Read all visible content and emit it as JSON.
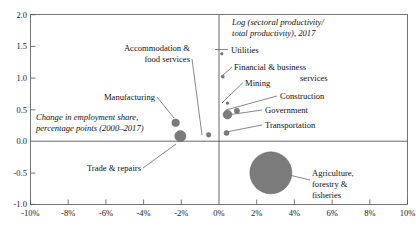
{
  "chart_data": {
    "type": "scatter",
    "title": "",
    "xlabel": "Change in employment share, percentage points (2000–2017)",
    "ylabel": "Log (sectoral productivity/ total productivity), 2017",
    "xlim": [
      -10,
      10
    ],
    "ylim": [
      -1.0,
      2.0
    ],
    "grid": false,
    "legend": "none",
    "x_ticks": [
      "-10%",
      "-8%",
      "-6%",
      "-4%",
      "-2%",
      "0%",
      "2%",
      "4%",
      "6%",
      "8%",
      "10%"
    ],
    "x_tick_values": [
      -10,
      -8,
      -6,
      -4,
      -2,
      0,
      2,
      4,
      6,
      8,
      10
    ],
    "y_ticks": [
      "2.0",
      "1.5",
      "1.0",
      "0.5",
      "0.0",
      "-0.5",
      "-1.0"
    ],
    "y_tick_values": [
      2.0,
      1.5,
      1.0,
      0.5,
      0.0,
      -0.5,
      -1.0
    ],
    "bubble_size_meaning": "employment share",
    "points": [
      {
        "name": "Utilities",
        "x": 0.15,
        "y": 1.38,
        "r": 1.3
      },
      {
        "name": "Financial & business services",
        "x": 0.2,
        "y": 1.02,
        "r": 1.6
      },
      {
        "name": "Mining",
        "x": 0.45,
        "y": 0.6,
        "r": 1.3
      },
      {
        "name": "Construction",
        "x": 0.95,
        "y": 0.48,
        "r": 2.6
      },
      {
        "name": "Government",
        "x": 0.45,
        "y": 0.42,
        "r": 4.4
      },
      {
        "name": "Transportation",
        "x": 0.4,
        "y": 0.13,
        "r": 2.5
      },
      {
        "name": "Manufacturing",
        "x": -2.3,
        "y": 0.29,
        "r": 3.8
      },
      {
        "name": "Trade & repairs",
        "x": -2.05,
        "y": 0.08,
        "r": 5.6
      },
      {
        "name": "Accommodation & food services",
        "x": -0.55,
        "y": 0.1,
        "r": 2.3
      },
      {
        "name": "Agriculture, forestry & fisheries",
        "x": 2.75,
        "y": -0.5,
        "r": 21.0
      }
    ]
  },
  "annotations": {
    "y_axis_note_line1": "Log (sectoral productivity/",
    "y_axis_note_line2": "total productivity), 2017",
    "x_axis_note_line1": "Change in employment share,",
    "x_axis_note_line2": "percentage points (2000–2017)",
    "utilities": "Utilities",
    "financial_line1": "Financial & business",
    "financial_line2": "services",
    "mining": "Mining",
    "construction": "Construction",
    "government": "Government",
    "transportation": "Transportation",
    "manufacturing": "Manufacturing",
    "accommodation_line1": "Accommodation &",
    "accommodation_line2": "food services",
    "trade": "Trade & repairs",
    "agriculture_line1": "Agriculture,",
    "agriculture_line2": "forestry &",
    "agriculture_line3": "fisheries"
  },
  "colors": {
    "bubble": "#7b7b7b",
    "frame": "#555555",
    "text": "#111111",
    "background": "#ffffff"
  }
}
